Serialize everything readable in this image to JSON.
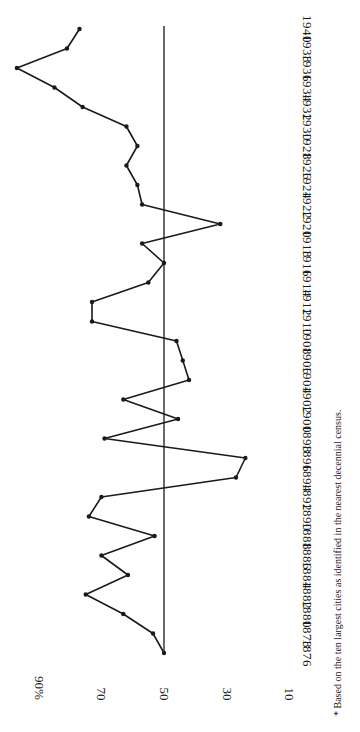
{
  "chart_data": {
    "type": "line",
    "orientation": "rotated-90-clockwise",
    "title": "",
    "xlabel": "Year",
    "ylabel": "Percent",
    "ylim": [
      10,
      100
    ],
    "y_ticks": [
      "90%",
      "70",
      "50",
      "30",
      "10"
    ],
    "y_tick_values": [
      90,
      70,
      50,
      30,
      10
    ],
    "reference_line": 50,
    "grid": false,
    "legend": null,
    "x": [
      1876,
      1878,
      1880,
      1882,
      1884,
      1886,
      1888,
      1890,
      1892,
      1894,
      1896,
      1898,
      1900,
      1902,
      1904,
      1906,
      1908,
      1910,
      1912,
      1914,
      1916,
      1918,
      1920,
      1922,
      1924,
      1926,
      1928,
      1930,
      1932,
      1934,
      1936,
      1938,
      1940
    ],
    "x_tick_labels": [
      "1876",
      "1878",
      "1880",
      "1882",
      "1884",
      "1886",
      "1888",
      "1890",
      "1892",
      "1894",
      "1896",
      "1898",
      "1900",
      "1902",
      "1904",
      "1906",
      "1908",
      "1910",
      "1912",
      "1914",
      "1916",
      "1918",
      "1920",
      "1922",
      "1924",
      "1926",
      "1928",
      "1930",
      "1932",
      "1934",
      "1936",
      "1938",
      "1940"
    ],
    "series": [
      {
        "name": "Percent",
        "values": [
          50,
          53.5,
          63,
          75,
          61.5,
          70,
          53,
          74,
          70,
          27,
          24,
          69,
          45.5,
          63,
          42,
          44,
          46,
          73,
          73,
          55,
          50,
          57,
          32,
          57,
          58.5,
          62,
          58.5,
          62,
          76,
          85,
          97,
          81,
          77
        ]
      }
    ],
    "annotations": [
      "* Based on the ten largest cities as identified in the nearest decennial census."
    ]
  },
  "footnote": "* Based on the ten largest cities as identified in the nearest decennial census.",
  "colors": {
    "line": "#1a1a1a",
    "background": "#ffffff"
  }
}
